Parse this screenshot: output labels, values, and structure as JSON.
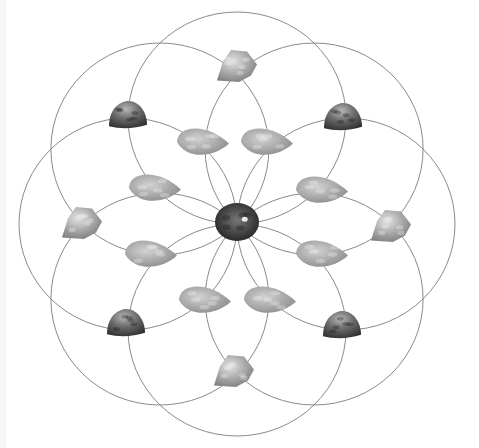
{
  "image": {
    "subject": "crystal-grid",
    "pattern": "eight-circle flower grid",
    "background": "#ffffff",
    "line_color": "#8a8a8a"
  },
  "grid": {
    "center": [
      237,
      224
    ],
    "circle_rx": 109,
    "circle_ry": 106,
    "circle_offset_x": 109,
    "circle_offset_y": 106,
    "circle_count": 8
  },
  "stones": {
    "center": {
      "name": "center-stone",
      "x": 237,
      "y": 222,
      "w": 44,
      "h": 38,
      "tone": "dark-speckled"
    },
    "cardinal": [
      {
        "name": "stone-top",
        "x": 237,
        "y": 66,
        "w": 40,
        "h": 32,
        "tone": "light"
      },
      {
        "name": "stone-right",
        "x": 391,
        "y": 226,
        "w": 40,
        "h": 32,
        "tone": "light"
      },
      {
        "name": "stone-bottom",
        "x": 234,
        "y": 371,
        "w": 40,
        "h": 32,
        "tone": "light"
      },
      {
        "name": "stone-left",
        "x": 82,
        "y": 223,
        "w": 40,
        "h": 32,
        "tone": "light"
      }
    ],
    "diagonal": [
      {
        "name": "stone-top-left",
        "x": 128,
        "y": 115,
        "w": 38,
        "h": 28,
        "tone": "dark"
      },
      {
        "name": "stone-top-right",
        "x": 343,
        "y": 117,
        "w": 38,
        "h": 28,
        "tone": "dark"
      },
      {
        "name": "stone-bottom-left",
        "x": 126,
        "y": 323,
        "w": 38,
        "h": 28,
        "tone": "dark"
      },
      {
        "name": "stone-bottom-right",
        "x": 342,
        "y": 325,
        "w": 38,
        "h": 28,
        "tone": "dark"
      }
    ],
    "inner": [
      {
        "name": "inner-stone-1",
        "x": 203,
        "y": 142,
        "w": 52,
        "h": 32
      },
      {
        "name": "inner-stone-2",
        "x": 267,
        "y": 142,
        "w": 52,
        "h": 32
      },
      {
        "name": "inner-stone-3",
        "x": 155,
        "y": 188,
        "w": 52,
        "h": 32
      },
      {
        "name": "inner-stone-4",
        "x": 322,
        "y": 190,
        "w": 52,
        "h": 32
      },
      {
        "name": "inner-stone-5",
        "x": 151,
        "y": 254,
        "w": 52,
        "h": 32
      },
      {
        "name": "inner-stone-6",
        "x": 322,
        "y": 254,
        "w": 52,
        "h": 32
      },
      {
        "name": "inner-stone-7",
        "x": 205,
        "y": 300,
        "w": 52,
        "h": 32
      },
      {
        "name": "inner-stone-8",
        "x": 270,
        "y": 300,
        "w": 52,
        "h": 32
      }
    ]
  }
}
